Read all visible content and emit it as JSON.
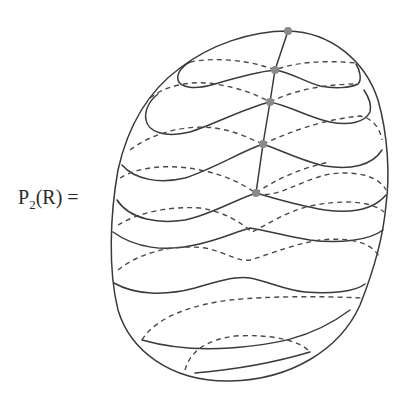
{
  "figure": {
    "label_main": "P",
    "label_sub": "2",
    "label_rest": "(R) =",
    "colors": {
      "line": "#3a3a3a",
      "dashed": "#4a4a4a",
      "dot": "#8a8a8a",
      "background": "#ffffff"
    },
    "marked_points": [
      {
        "x": 288,
        "y": 31
      },
      {
        "x": 275,
        "y": 70
      },
      {
        "x": 270,
        "y": 102
      },
      {
        "x": 263,
        "y": 144
      },
      {
        "x": 256,
        "y": 193
      }
    ]
  }
}
